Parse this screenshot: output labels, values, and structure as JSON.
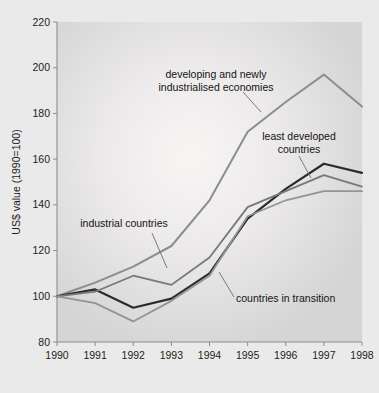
{
  "figure": {
    "background_color": "#ebeaea",
    "plot_background_color": "#dcdcdc",
    "plot_highlight_color": "#f4f3f1"
  },
  "axis": {
    "y_title": "US$ value (1990=100)",
    "y_ticks": [
      "220",
      "200",
      "180",
      "160",
      "140",
      "120",
      "100",
      "80"
    ],
    "x_ticks": [
      "1990",
      "1991",
      "1992",
      "1993",
      "1994",
      "1995",
      "1996",
      "1997",
      "1998"
    ]
  },
  "annotations": [
    {
      "name": "developing-and-newly-industrialised-economies",
      "line1": "developing and newly",
      "line2": "industrialised economies"
    },
    {
      "name": "least-developed-countries",
      "line1": "least developed",
      "line2": "countries"
    },
    {
      "name": "industrial-countries",
      "line1": "industrial countries",
      "line2": ""
    },
    {
      "name": "countries-in-transition",
      "line1": "countries in transition",
      "line2": ""
    }
  ],
  "chart_data": {
    "type": "line",
    "title": "",
    "xlabel": "",
    "ylabel": "US$ value (1990=100)",
    "xlim": [
      1990,
      1998
    ],
    "ylim": [
      80,
      220
    ],
    "ytick_step": 20,
    "grid": false,
    "legend": "annotated-inline",
    "x": [
      1990,
      1991,
      1992,
      1993,
      1994,
      1995,
      1996,
      1997,
      1998
    ],
    "series": [
      {
        "name": "developing and newly industrialised economies",
        "color": "#8d8d8d",
        "width": 2.0,
        "values": [
          100,
          106,
          113,
          122,
          142,
          172,
          185,
          197,
          183
        ]
      },
      {
        "name": "least developed countries",
        "color": "#2b2b2b",
        "width": 2.2,
        "values": [
          100,
          103,
          95,
          99,
          110,
          134,
          147,
          158,
          154
        ]
      },
      {
        "name": "industrial countries",
        "color": "#787878",
        "width": 1.8,
        "values": [
          100,
          102,
          109,
          105,
          117,
          139,
          146,
          153,
          148
        ]
      },
      {
        "name": "countries in transition",
        "color": "#949494",
        "width": 1.8,
        "values": [
          100,
          97,
          89,
          98,
          109,
          135,
          142,
          146,
          146
        ]
      }
    ]
  }
}
